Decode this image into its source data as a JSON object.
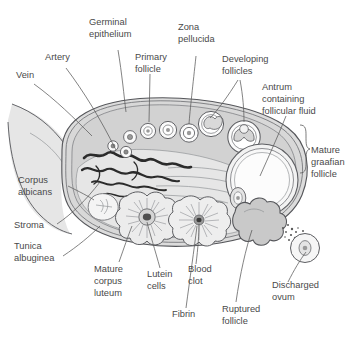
{
  "figure": {
    "width": 348,
    "height": 346,
    "background": "#ffffff"
  },
  "colors": {
    "label_text": "#4a4a4a",
    "leader_line": "#5a5a5a",
    "outline": "#55565a",
    "stroma_fill": "#d6d6d6",
    "cortex_fill": "#e2e2e2",
    "medulla_fill": "#e8e8e8",
    "mesovarium_fill": "#e4e4e4",
    "follicle_fill": "#ffffff",
    "antrum_fill": "#fbfbfb",
    "vessel_dark": "#2e2e2e",
    "lutein_fill": "#e9e9e9",
    "ruptured_fill": "#c9c9c9",
    "clot_dark": "#4a4a4a"
  },
  "labels": [
    {
      "id": "vein",
      "lines": [
        "Vein"
      ],
      "x": 16,
      "y": 78,
      "anchor": "start"
    },
    {
      "id": "artery",
      "lines": [
        "Artery"
      ],
      "x": 45,
      "y": 60,
      "anchor": "start"
    },
    {
      "id": "germinal-epithelium",
      "lines": [
        "Germinal",
        "epithelium"
      ],
      "x": 89,
      "y": 25,
      "anchor": "start"
    },
    {
      "id": "primary-follicle",
      "lines": [
        "Primary",
        "follicle"
      ],
      "x": 135,
      "y": 60,
      "anchor": "start"
    },
    {
      "id": "zona-pellucida",
      "lines": [
        "Zona",
        "pellucida"
      ],
      "x": 178,
      "y": 30,
      "anchor": "start"
    },
    {
      "id": "developing-follicles",
      "lines": [
        "Developing",
        "follicles"
      ],
      "x": 222,
      "y": 62,
      "anchor": "start"
    },
    {
      "id": "antrum",
      "lines": [
        "Antrum",
        "containing",
        "follicular fluid"
      ],
      "x": 262,
      "y": 90,
      "anchor": "start"
    },
    {
      "id": "mature-graafian",
      "lines": [
        "Mature",
        "graafian",
        "follicle"
      ],
      "x": 311,
      "y": 153,
      "anchor": "start"
    },
    {
      "id": "corpus-albicans",
      "lines": [
        "Corpus",
        "albicans"
      ],
      "x": 18,
      "y": 183,
      "anchor": "start"
    },
    {
      "id": "stroma",
      "lines": [
        "Stroma"
      ],
      "x": 14,
      "y": 228,
      "anchor": "start"
    },
    {
      "id": "tunica-albuginea",
      "lines": [
        "Tunica",
        "albuginea"
      ],
      "x": 14,
      "y": 249,
      "anchor": "start"
    },
    {
      "id": "mature-corpus-luteum",
      "lines": [
        "Mature",
        "corpus",
        "luteum"
      ],
      "x": 94,
      "y": 272,
      "anchor": "start"
    },
    {
      "id": "lutein-cells",
      "lines": [
        "Lutein",
        "cells"
      ],
      "x": 147,
      "y": 277,
      "anchor": "start"
    },
    {
      "id": "blood-clot",
      "lines": [
        "Blood",
        "clot"
      ],
      "x": 188,
      "y": 272,
      "anchor": "start"
    },
    {
      "id": "fibrin",
      "lines": [
        "Fibrin"
      ],
      "x": 172,
      "y": 317,
      "anchor": "start"
    },
    {
      "id": "ruptured-follicle",
      "lines": [
        "Ruptured",
        "follicle"
      ],
      "x": 222,
      "y": 312,
      "anchor": "start"
    },
    {
      "id": "discharged-ovum",
      "lines": [
        "Discharged",
        "ovum"
      ],
      "x": 272,
      "y": 288,
      "anchor": "start"
    }
  ],
  "structures": [
    {
      "id": "mesovarium",
      "name": "mesovarium-ligament"
    },
    {
      "id": "germinal-epithelium",
      "name": "germinal-epithelium-layer"
    },
    {
      "id": "tunica-albuginea",
      "name": "tunica-albuginea-layer"
    },
    {
      "id": "cortex",
      "name": "ovarian-cortex"
    },
    {
      "id": "medulla",
      "name": "ovarian-medulla"
    },
    {
      "id": "blood-vessels",
      "name": "hilar-blood-vessels"
    },
    {
      "id": "corpus-albicans",
      "name": "corpus-albicans-body"
    },
    {
      "id": "primary-follicles",
      "name": "primary-follicle-series",
      "count": 6
    },
    {
      "id": "developing-follicles",
      "name": "developing-follicle-group",
      "count": 2
    },
    {
      "id": "graafian-follicle",
      "name": "mature-graafian-follicle"
    },
    {
      "id": "corpus-luteum",
      "name": "mature-corpus-luteum-body"
    },
    {
      "id": "lutein-body",
      "name": "lutein-cell-body"
    },
    {
      "id": "ruptured-follicle",
      "name": "ruptured-follicle-body"
    },
    {
      "id": "discharged-ovum",
      "name": "discharged-ovum-cell"
    }
  ]
}
